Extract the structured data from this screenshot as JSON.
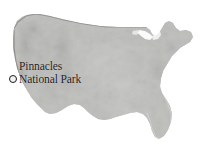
{
  "figure": {
    "kind": "locator-map",
    "region": "Contiguous United States",
    "background_color": "#ffffff",
    "style": "grayscale shaded relief"
  },
  "marker": {
    "icon": "circle-marker-icon",
    "fill_color": "#f2f2f0",
    "ring_color": "#1b1b1a",
    "x_px": 13,
    "y_px": 79
  },
  "label": {
    "line1": "Pinnacles",
    "line2": "National Park",
    "full_text": "Pinnacles National Park",
    "color": "#20201e",
    "x_px": 19,
    "y_px": 60
  },
  "terrain": {
    "palette": {
      "lowland": "#d7d7d5",
      "plains": "#c6c6c4",
      "midland": "#b2b2b0",
      "upland": "#9d9d9b",
      "highland": "#878785",
      "peaks": "#6f6f6d",
      "coastline": "#8a8a88"
    },
    "regions": [
      {
        "name": "pacific-coast-ranges",
        "shade": "#8d8d8b"
      },
      {
        "name": "cascades-sierra-nevada",
        "shade": "#7f7f7d"
      },
      {
        "name": "great-basin",
        "shade": "#a8a8a6"
      },
      {
        "name": "rocky-mountains",
        "shade": "#858583"
      },
      {
        "name": "great-plains",
        "shade": "#cfcfcd"
      },
      {
        "name": "central-lowlands",
        "shade": "#d9d9d7"
      },
      {
        "name": "appalachians",
        "shade": "#a0a09e"
      },
      {
        "name": "atlantic-coastal-plain",
        "shade": "#c9c9c7"
      },
      {
        "name": "gulf-coastal-plain",
        "shade": "#cdcdcb"
      },
      {
        "name": "florida-peninsula",
        "shade": "#b8b8b6"
      },
      {
        "name": "new-england",
        "shade": "#aeaeac"
      },
      {
        "name": "great-lakes-notch",
        "shade": "#ffffff"
      }
    ]
  }
}
